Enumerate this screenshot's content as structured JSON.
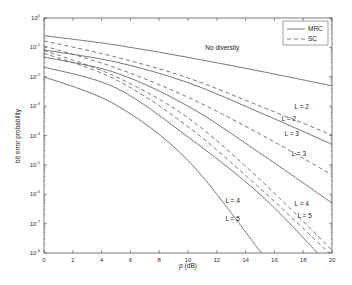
{
  "chart_data": {
    "type": "line",
    "title": "",
    "xlabel": "ρ (dB)",
    "ylabel": "bit error probability",
    "xlim": [
      0,
      20
    ],
    "ylim": [
      1e-08,
      1
    ],
    "yscale": "log",
    "grid": false,
    "x_ticks": [
      0,
      2,
      4,
      6,
      8,
      10,
      12,
      14,
      16,
      18,
      20
    ],
    "y_ticks": [
      "10^0",
      "10^-1",
      "10^-2",
      "10^-3",
      "10^-4",
      "10^-5",
      "10^-6",
      "10^-7",
      "10^-8"
    ],
    "legend": {
      "position": "upper right",
      "entries": [
        {
          "label": "MRC",
          "style": "solid"
        },
        {
          "label": "SC",
          "style": "dashed"
        }
      ]
    },
    "series": [
      {
        "name": "No diversity",
        "style": "solid",
        "x": [
          0,
          5,
          10,
          15,
          20
        ],
        "log10_y": [
          -0.6,
          -0.92,
          -1.34,
          -1.81,
          -2.31
        ]
      },
      {
        "name": "SC L = 2",
        "style": "dashed",
        "x": [
          0,
          5,
          10,
          15,
          20
        ],
        "log10_y": [
          -0.78,
          -1.33,
          -2.04,
          -3.0,
          -3.98
        ]
      },
      {
        "name": "MRC L = 2",
        "style": "solid",
        "x": [
          0,
          5,
          10,
          15,
          20
        ],
        "log10_y": [
          -1.09,
          -1.5,
          -2.2,
          -3.22,
          -4.3
        ]
      },
      {
        "name": "SC L = 3",
        "style": "dashed",
        "x": [
          0,
          5,
          10,
          15,
          20
        ],
        "log10_y": [
          -0.95,
          -1.7,
          -2.7,
          -3.95,
          -5.34
        ]
      },
      {
        "name": "MRC L = 3",
        "style": "solid",
        "x": [
          0,
          5,
          10,
          15,
          20
        ],
        "log10_y": [
          -1.33,
          -1.87,
          -3.0,
          -4.6,
          -6.3
        ]
      },
      {
        "name": "SC L = 4",
        "style": "dashed",
        "x": [
          0,
          5,
          10,
          15,
          20
        ],
        "log10_y": [
          -1.1,
          -2.0,
          -3.4,
          -5.5,
          -7.9
        ]
      },
      {
        "name": "SC L = 5",
        "style": "dashed",
        "x": [
          0,
          5,
          10,
          15,
          19.8
        ],
        "log10_y": [
          -1.2,
          -2.1,
          -3.7,
          -5.8,
          -8.0
        ]
      },
      {
        "name": "MRC L = 4",
        "style": "solid",
        "x": [
          0,
          5,
          10,
          15,
          19
        ],
        "log10_y": [
          -1.67,
          -2.38,
          -4.05,
          -6.0,
          -8.0
        ]
      },
      {
        "name": "MRC L = 5",
        "style": "solid",
        "x": [
          0,
          5,
          10,
          15.1
        ],
        "log10_y": [
          -2.0,
          -2.96,
          -4.85,
          -8.0
        ]
      }
    ],
    "annotations": [
      {
        "text": "No diversity",
        "x": 11.2,
        "log10_y": -1.1
      },
      {
        "text": "L = 2",
        "x": 17.4,
        "log10_y": -3.1
      },
      {
        "text": "L = 2",
        "x": 16.5,
        "log10_y": -3.5
      },
      {
        "text": "L = 3",
        "x": 16.7,
        "log10_y": -4.0
      },
      {
        "text": "L = 3",
        "x": 17.2,
        "log10_y": -4.7
      },
      {
        "text": "L = 4",
        "x": 12.6,
        "log10_y": -6.3
      },
      {
        "text": "L = 4",
        "x": 17.4,
        "log10_y": -6.4
      },
      {
        "text": "L = 5",
        "x": 12.6,
        "log10_y": -6.9
      },
      {
        "text": "L = 5",
        "x": 17.6,
        "log10_y": -6.8
      }
    ]
  }
}
